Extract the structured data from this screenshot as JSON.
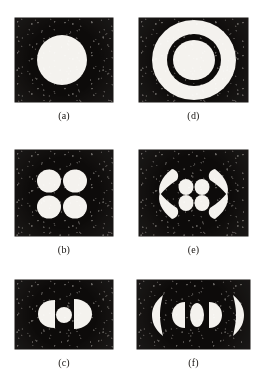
{
  "figure": {
    "background_color": "#ffffff",
    "panel_background_color": "#0d0b0a",
    "blob_color": "#f4f2ee",
    "layout": {
      "rows": 3,
      "columns": 2
    },
    "panels": [
      {
        "id": "panel-a",
        "caption": "(a)",
        "description": "single filled white disc on noisy dark background",
        "shape_count": 1,
        "shapes": [
          {
            "type": "disc",
            "cx": 47,
            "cy": 42,
            "rx": 25,
            "ry": 25
          }
        ],
        "rect": {
          "x": 15,
          "y": 18,
          "w": 98,
          "h": 84
        }
      },
      {
        "id": "panel-d",
        "caption": "(d)",
        "description": "white annulus: outer disc with dark ring and bright core",
        "shape_count": 3,
        "shapes": [
          {
            "type": "disc",
            "cx": 55,
            "cy": 42,
            "rx": 42,
            "ry": 40
          },
          {
            "type": "ring-gap",
            "cx": 55,
            "cy": 42,
            "rx": 27,
            "ry": 26
          },
          {
            "type": "disc",
            "cx": 55,
            "cy": 42,
            "rx": 21,
            "ry": 20
          }
        ],
        "rect": {
          "x": 139,
          "y": 18,
          "w": 109,
          "h": 84
        }
      },
      {
        "id": "panel-b",
        "caption": "(b)",
        "description": "four white discs arranged in a two by two square",
        "shape_count": 4,
        "shapes": [
          {
            "type": "disc",
            "cx": 34,
            "cy": 30,
            "rx": 12,
            "ry": 11
          },
          {
            "type": "disc",
            "cx": 60,
            "cy": 30,
            "rx": 12,
            "ry": 11
          },
          {
            "type": "disc",
            "cx": 34,
            "cy": 56,
            "rx": 12,
            "ry": 11
          },
          {
            "type": "disc",
            "cx": 60,
            "cy": 56,
            "rx": 12,
            "ry": 11
          }
        ],
        "rect": {
          "x": 15,
          "y": 150,
          "w": 98,
          "h": 86
        }
      },
      {
        "id": "panel-e",
        "caption": "(e)",
        "description": "four corner crescents surrounding four small central ellipses",
        "shape_count": 8,
        "shapes": [
          {
            "type": "crescent",
            "position": "top-left"
          },
          {
            "type": "crescent",
            "position": "top-right"
          },
          {
            "type": "crescent",
            "position": "bottom-left"
          },
          {
            "type": "crescent",
            "position": "bottom-right"
          },
          {
            "type": "ellipse",
            "position": "center-top-left"
          },
          {
            "type": "ellipse",
            "position": "center-top-right"
          },
          {
            "type": "ellipse",
            "position": "center-bottom-left"
          },
          {
            "type": "ellipse",
            "position": "center-bottom-right"
          }
        ],
        "rect": {
          "x": 139,
          "y": 150,
          "w": 109,
          "h": 86
        }
      },
      {
        "id": "panel-c",
        "caption": "(c)",
        "description": "left half-disc, small central circle, right half-disc in a horizontal row",
        "shape_count": 3,
        "shapes": [
          {
            "type": "half-disc",
            "orientation": "flat-right",
            "cx": 34,
            "cy": 33
          },
          {
            "type": "disc",
            "cx": 49,
            "cy": 34,
            "rx": 8,
            "ry": 8
          },
          {
            "type": "half-disc",
            "orientation": "flat-left",
            "cx": 64,
            "cy": 33
          }
        ],
        "rect": {
          "x": 15,
          "y": 280,
          "w": 98,
          "h": 69
        }
      },
      {
        "id": "panel-f",
        "caption": "(f)",
        "description": "five shapes in a horizontal row: crescent, half-disc, ellipse, half-disc, crescent",
        "shape_count": 5,
        "shapes": [
          {
            "type": "crescent",
            "orientation": "opens-right",
            "position": "far-left"
          },
          {
            "type": "half-disc",
            "orientation": "flat-right",
            "position": "left"
          },
          {
            "type": "ellipse",
            "position": "center"
          },
          {
            "type": "half-disc",
            "orientation": "flat-left",
            "position": "right"
          },
          {
            "type": "crescent",
            "orientation": "opens-left",
            "position": "far-right"
          }
        ],
        "rect": {
          "x": 137,
          "y": 280,
          "w": 113,
          "h": 69
        }
      }
    ]
  }
}
